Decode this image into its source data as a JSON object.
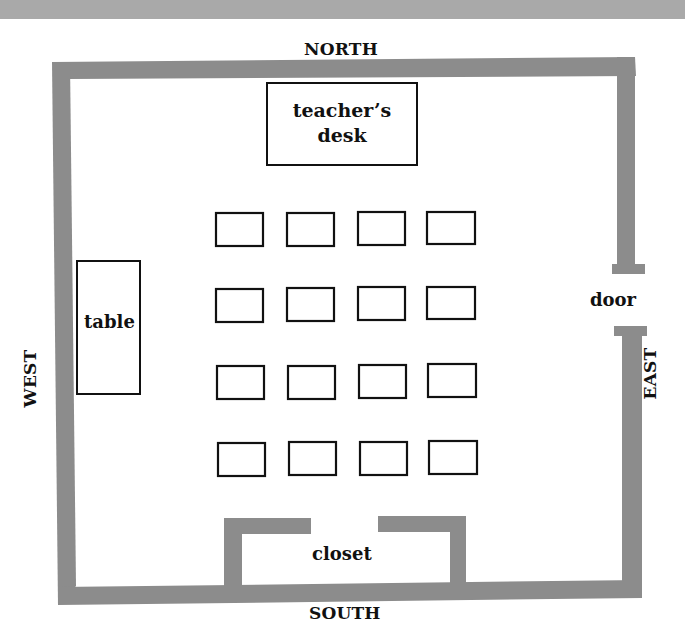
{
  "diagram": {
    "type": "classroom-floor-plan",
    "colors": {
      "wall": "#8c8c8c",
      "banner": "#a9a9a9",
      "outline": "#111111",
      "background": "#ffffff"
    },
    "compass": {
      "north": "NORTH",
      "south": "SOUTH",
      "east": "EAST",
      "west": "WEST"
    },
    "labels": {
      "teachers_desk_line1": "teacher’s",
      "teachers_desk_line2": "desk",
      "table": "table",
      "door": "door",
      "closet": "closet"
    },
    "student_desks": {
      "rows": 4,
      "columns": 4,
      "count": 16
    }
  }
}
